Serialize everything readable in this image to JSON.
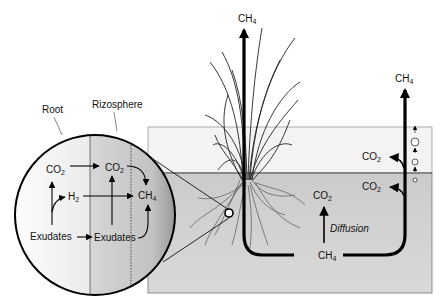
{
  "diagram": {
    "colors": {
      "water_layer": "#f1f1f1",
      "soil_layer": "#cfcfcf",
      "soil_border": "#777777",
      "arrow": "#000000",
      "root_zone": "#f3f3f3",
      "rhizosphere_zone": "#c9c9c9"
    },
    "inset": {
      "labels": {
        "root": "Root",
        "rhizosphere": "Rizosphere"
      },
      "nodes": {
        "co2_root": {
          "base": "CO",
          "sub": "2"
        },
        "co2_rhizo": {
          "base": "CO",
          "sub": "2"
        },
        "h2": {
          "base": "H",
          "sub": "2"
        },
        "ch4": {
          "base": "CH",
          "sub": "4"
        },
        "exudates_root": "Exudates",
        "exudates_rhizo": "Exudates"
      }
    },
    "main": {
      "plant_ch4": {
        "base": "CH",
        "sub": "4"
      },
      "ebullition_ch4": {
        "base": "CH",
        "sub": "4"
      },
      "water_co2": {
        "base": "CO",
        "sub": "2"
      },
      "soil_co2_right": {
        "base": "CO",
        "sub": "2"
      },
      "soil_co2_center": {
        "base": "CO",
        "sub": "2"
      },
      "diffusion_label": "Diffusion",
      "soil_ch4": {
        "base": "CH",
        "sub": "4"
      }
    }
  }
}
